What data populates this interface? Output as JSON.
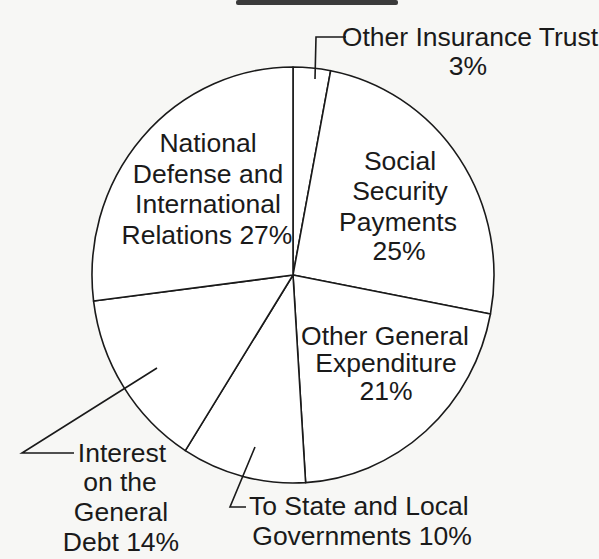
{
  "chart_data": {
    "type": "pie",
    "title": "",
    "title_note": "title is cropped off the top edge (only bottom of bold text visible)",
    "start_angle_deg": 0,
    "direction": "clockwise",
    "slices": [
      {
        "label": "Other Insurance Trust",
        "value": 3,
        "display": "3%",
        "label_lines": [
          "Other Insurance Trust",
          "3%"
        ],
        "callout": true
      },
      {
        "label": "Social Security Payments",
        "value": 25,
        "display": "25%",
        "label_lines": [
          "Social",
          "Security",
          "Payments",
          "25%"
        ],
        "callout": false
      },
      {
        "label": "Other General Expenditure",
        "value": 21,
        "display": "21%",
        "label_lines": [
          "Other General",
          "Expenditure",
          "21%"
        ],
        "callout": false
      },
      {
        "label": "To State and Local Governments",
        "value": 10,
        "display": "10%",
        "label_lines": [
          "To State and Local",
          "Governments 10%"
        ],
        "callout": true
      },
      {
        "label": "Interest on the General Debt",
        "value": 14,
        "display": "14%",
        "label_lines": [
          "Interest",
          "on the",
          "General",
          "Debt 14%"
        ],
        "callout": true
      },
      {
        "label": "National Defense and International Relations",
        "value": 27,
        "display": "27%",
        "label_lines": [
          "National",
          "Defense and",
          "International",
          "Relations 27%"
        ],
        "callout": false
      }
    ],
    "colors": {
      "fill": "#ffffff",
      "stroke": "#1a1a1a",
      "background": "#f7f7f5"
    },
    "legend": "none (direct labels)"
  }
}
